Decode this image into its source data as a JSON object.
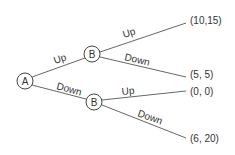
{
  "tree": {
    "root": {
      "label": "A"
    },
    "nodes": [
      {
        "label": "B"
      },
      {
        "label": "B"
      }
    ],
    "edges": [
      {
        "label": "Up"
      },
      {
        "label": "Down"
      },
      {
        "label": "Up"
      },
      {
        "label": "Down"
      },
      {
        "label": "Up"
      },
      {
        "label": "Down"
      }
    ],
    "payoffs": [
      {
        "label": "(10,15)"
      },
      {
        "label": "(5, 5)"
      },
      {
        "label": "(0, 0)"
      },
      {
        "label": "(6, 20)"
      }
    ]
  }
}
